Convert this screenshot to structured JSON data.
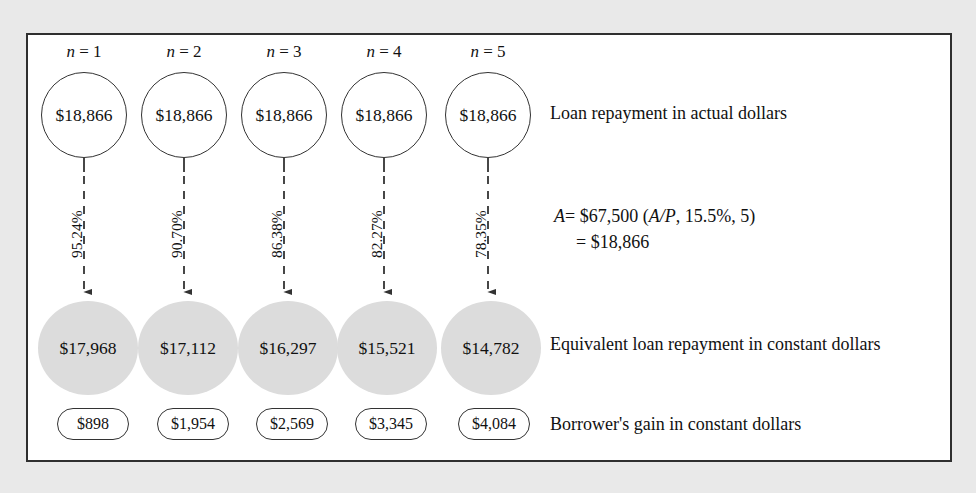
{
  "figure": {
    "frame_border_color": "#2f2f2f",
    "page_background": "#e9e9e9",
    "frame_background": "#ffffff",
    "gray_circle_color": "#dcdcdc",
    "text_color": "#111111"
  },
  "columns": [
    {
      "period_label": "n = 1",
      "period_prefix": "n",
      "period_value": "1",
      "actual_dollars": "$18,866",
      "deflation_factor": "95.24%",
      "constant_dollars": "$17,968",
      "borrower_gain": "$898"
    },
    {
      "period_label": "n = 2",
      "period_prefix": "n",
      "period_value": "2",
      "actual_dollars": "$18,866",
      "deflation_factor": "90.70%",
      "constant_dollars": "$17,112",
      "borrower_gain": "$1,954"
    },
    {
      "period_label": "n = 3",
      "period_prefix": "n",
      "period_value": "3",
      "actual_dollars": "$18,866",
      "deflation_factor": "86.38%",
      "constant_dollars": "$16,297",
      "borrower_gain": "$2,569"
    },
    {
      "period_label": "n = 4",
      "period_prefix": "n",
      "period_value": "4",
      "actual_dollars": "$18,866",
      "deflation_factor": "82.27%",
      "constant_dollars": "$15,521",
      "borrower_gain": "$3,345"
    },
    {
      "period_label": "n = 5",
      "period_prefix": "n",
      "period_value": "5",
      "actual_dollars": "$18,866",
      "deflation_factor": "78.35%",
      "constant_dollars": "$14,782",
      "borrower_gain": "$4,084"
    }
  ],
  "captions": {
    "actual_row": "Loan repayment in actual dollars",
    "constant_row": "Equivalent loan repayment in constant dollars",
    "gain_row": "Borrower's gain in constant dollars"
  },
  "formula": {
    "line1_lhs": "A",
    "line1_eq": "= $67,500 (",
    "line1_factor": "A/P",
    "line1_rest": ", 15.5%, 5)",
    "line2": "= $18,866",
    "full_text": "A = $67,500 (A/P, 15.5%, 5) = $18,866"
  },
  "chart_data": {
    "type": "diagram",
    "categories": [
      "n = 1",
      "n = 2",
      "n = 3",
      "n = 4",
      "n = 5"
    ],
    "series": [
      {
        "name": "Loan repayment in actual dollars",
        "values": [
          18866,
          18866,
          18866,
          18866,
          18866
        ]
      },
      {
        "name": "Deflation factor (%)",
        "values": [
          95.24,
          90.7,
          86.38,
          82.27,
          78.35
        ]
      },
      {
        "name": "Equivalent loan repayment in constant dollars",
        "values": [
          17968,
          17112,
          16297,
          15521,
          14782
        ]
      },
      {
        "name": "Borrower's gain in constant dollars",
        "values": [
          898,
          1954,
          2569,
          3345,
          4084
        ]
      }
    ],
    "annotations": [
      "A = $67,500 (A/P, 15.5%, 5) = $18,866"
    ],
    "xlabel": "",
    "ylabel": "",
    "grid": false,
    "legend": "right"
  }
}
